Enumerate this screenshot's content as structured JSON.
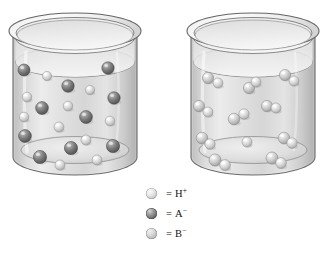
{
  "figure": {
    "title": "",
    "background_color": "#ffffff",
    "width": 332,
    "height": 255
  },
  "chart_data": {
    "type": "diagram",
    "title": "",
    "xlabel": "",
    "ylabel": "",
    "legend_position": "below-center",
    "grid": false,
    "series": [
      {
        "name": "H+",
        "label": "H",
        "charge": "+",
        "color": "#e4e4e4",
        "count_left_beaker": 14,
        "count_right_beaker": 11
      },
      {
        "name": "A-",
        "label": "A",
        "charge": "−",
        "color": "#7a7a7a",
        "count_left_beaker": 14,
        "count_right_beaker": 0
      },
      {
        "name": "B-",
        "label": "B",
        "charge": "−",
        "color": "#c4c4c4",
        "count_left_beaker": 0,
        "count_right_beaker": 11
      }
    ],
    "panels": [
      {
        "name": "left-beaker",
        "caption": "",
        "species_present": [
          "H+",
          "A-"
        ],
        "particle_pairs": 0,
        "particles": [
          {
            "species": "A-",
            "x": 24,
            "y": 70,
            "r": 6.0
          },
          {
            "species": "H+",
            "x": 47,
            "y": 76,
            "r": 4.6
          },
          {
            "species": "A-",
            "x": 68,
            "y": 86,
            "r": 6.2
          },
          {
            "species": "A-",
            "x": 108,
            "y": 68,
            "r": 6.2
          },
          {
            "species": "H+",
            "x": 90,
            "y": 90,
            "r": 4.6
          },
          {
            "species": "A-",
            "x": 114,
            "y": 98,
            "r": 6.2
          },
          {
            "species": "H+",
            "x": 27,
            "y": 97,
            "r": 4.8
          },
          {
            "species": "A-",
            "x": 42,
            "y": 108,
            "r": 6.4
          },
          {
            "species": "H+",
            "x": 68,
            "y": 106,
            "r": 4.8
          },
          {
            "species": "H+",
            "x": 24,
            "y": 117,
            "r": 4.8
          },
          {
            "species": "A-",
            "x": 86,
            "y": 117,
            "r": 6.4
          },
          {
            "species": "H+",
            "x": 110,
            "y": 121,
            "r": 4.8
          },
          {
            "species": "H+",
            "x": 59,
            "y": 127,
            "r": 5.0
          },
          {
            "species": "A-",
            "x": 25,
            "y": 136,
            "r": 6.4
          },
          {
            "species": "H+",
            "x": 86,
            "y": 140,
            "r": 5.0
          },
          {
            "species": "A-",
            "x": 71,
            "y": 148,
            "r": 6.6
          },
          {
            "species": "A-",
            "x": 113,
            "y": 146,
            "r": 6.6
          },
          {
            "species": "A-",
            "x": 40,
            "y": 157,
            "r": 6.6
          },
          {
            "species": "H+",
            "x": 60,
            "y": 165,
            "r": 5.0
          },
          {
            "species": "H+",
            "x": 97,
            "y": 160,
            "r": 5.0
          }
        ]
      },
      {
        "name": "right-beaker",
        "caption": "",
        "species_present": [
          "H+",
          "B-"
        ],
        "particle_pairs": 8,
        "particles": [
          {
            "species": "B-",
            "x": 208,
            "y": 78,
            "r": 5.6
          },
          {
            "species": "H+",
            "x": 218,
            "y": 83,
            "r": 5.0
          },
          {
            "species": "B-",
            "x": 249,
            "y": 88,
            "r": 5.6
          },
          {
            "species": "H+",
            "x": 256,
            "y": 82,
            "r": 5.0
          },
          {
            "species": "B-",
            "x": 285,
            "y": 75,
            "r": 5.6
          },
          {
            "species": "H+",
            "x": 294,
            "y": 81,
            "r": 5.0
          },
          {
            "species": "B-",
            "x": 199,
            "y": 106,
            "r": 5.6
          },
          {
            "species": "H+",
            "x": 208,
            "y": 112,
            "r": 5.0
          },
          {
            "species": "B-",
            "x": 267,
            "y": 106,
            "r": 5.6
          },
          {
            "species": "H+",
            "x": 276,
            "y": 108,
            "r": 5.0
          },
          {
            "species": "B-",
            "x": 234,
            "y": 119,
            "r": 5.8
          },
          {
            "species": "H+",
            "x": 244,
            "y": 114,
            "r": 5.2
          },
          {
            "species": "B-",
            "x": 202,
            "y": 138,
            "r": 5.8
          },
          {
            "species": "H+",
            "x": 210,
            "y": 144,
            "r": 5.2
          },
          {
            "species": "B-",
            "x": 284,
            "y": 138,
            "r": 5.8
          },
          {
            "species": "H+",
            "x": 292,
            "y": 143,
            "r": 5.2
          },
          {
            "species": "H+",
            "x": 247,
            "y": 142,
            "r": 5.0
          },
          {
            "species": "B-",
            "x": 215,
            "y": 160,
            "r": 6.0
          },
          {
            "species": "H+",
            "x": 225,
            "y": 165,
            "r": 5.4
          },
          {
            "species": "B-",
            "x": 272,
            "y": 158,
            "r": 6.0
          },
          {
            "species": "H+",
            "x": 281,
            "y": 163,
            "r": 5.4
          }
        ]
      }
    ],
    "annotations": []
  },
  "legend": {
    "items": [
      {
        "icon": "sphere-icon",
        "equals": "=",
        "label": "H",
        "charge": "+",
        "text": "= H⁺",
        "swatch_color": "#e4e4e4"
      },
      {
        "icon": "sphere-icon",
        "equals": "=",
        "label": "A",
        "charge": "−",
        "text": "= A⁻",
        "swatch_color": "#7a7a7a"
      },
      {
        "icon": "sphere-icon",
        "equals": "=",
        "label": "B",
        "charge": "−",
        "text": "= B⁻",
        "swatch_color": "#c4c4c4"
      }
    ]
  },
  "colors": {
    "background": "#ffffff",
    "glass_outline": "#58595b",
    "glass_body_light": "#f1f1f1",
    "glass_body_shade": "#cfcfcf",
    "solution_fill": "#dcdcdc",
    "h_plus": "#e4e4e4",
    "a_minus": "#7a7a7a",
    "b_minus": "#c4c4c4",
    "text": "#111111"
  }
}
